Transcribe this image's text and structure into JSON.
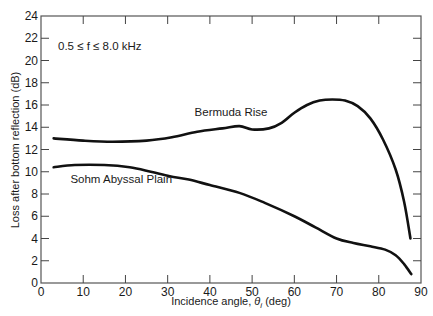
{
  "chart_data": {
    "type": "line",
    "title": "",
    "annotation": "0.5 ≤ f ≤ 8.0 kHz",
    "xlabel": "Incidence angle, θi (deg)",
    "ylabel": "Loss after bottom reflection (dB)",
    "xlim": [
      0,
      90
    ],
    "ylim": [
      0,
      24
    ],
    "xticks": [
      0,
      10,
      20,
      30,
      40,
      50,
      60,
      70,
      80,
      90
    ],
    "yticks": [
      0,
      2,
      4,
      6,
      8,
      10,
      12,
      14,
      16,
      18,
      20,
      22,
      24
    ],
    "grid": false,
    "legend": "inline labels",
    "series": [
      {
        "name": "Bermuda Rise",
        "label_position": [
          45,
          15.0
        ],
        "x": [
          3,
          10,
          17,
          25,
          31,
          37,
          43,
          47,
          50,
          54,
          57,
          60,
          63,
          66,
          69,
          72,
          75,
          78,
          81,
          84,
          86,
          87.5
        ],
        "y": [
          13.0,
          12.8,
          12.7,
          12.8,
          13.1,
          13.6,
          13.9,
          14.1,
          13.8,
          13.9,
          14.4,
          15.3,
          16.0,
          16.4,
          16.5,
          16.4,
          15.9,
          14.8,
          12.9,
          10.2,
          7.3,
          4.0
        ]
      },
      {
        "name": "Sohm Abyssal Plain",
        "label_position": [
          19,
          9.0
        ],
        "x": [
          3,
          8,
          15,
          21,
          26,
          30.5,
          35,
          40,
          47,
          53,
          60,
          65,
          70,
          74,
          78,
          81.5,
          84,
          86,
          87.7
        ],
        "y": [
          10.4,
          10.6,
          10.6,
          10.4,
          10.0,
          9.6,
          9.3,
          8.8,
          8.1,
          7.2,
          6.0,
          5.0,
          4.0,
          3.6,
          3.3,
          3.0,
          2.5,
          1.7,
          0.8
        ]
      }
    ]
  }
}
